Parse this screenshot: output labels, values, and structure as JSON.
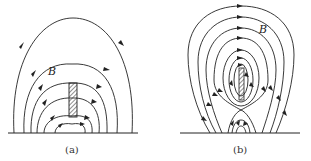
{
  "figure": {
    "panels": [
      {
        "id": "a",
        "label": "(a)",
        "field_label": "B",
        "description": "Magnetic field lines of a bar above a conducting plane, lines originating and terminating on the ground plane"
      },
      {
        "id": "b",
        "label": "(b)",
        "field_label": "B",
        "description": "Closed field line loops around a bar with an X-point below it and lines connecting to the ground plane"
      }
    ],
    "colors": {
      "line": "#222222",
      "background": "#ffffff",
      "hatch": "#444444"
    }
  }
}
